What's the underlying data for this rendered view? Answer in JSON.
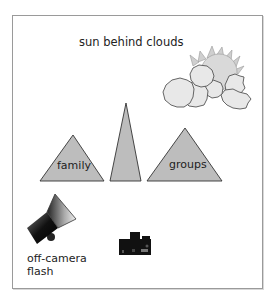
{
  "diagram": {
    "title": "sun behind clouds",
    "labels": {
      "family": "family",
      "groups": "groups",
      "flash_line1": "off-camera",
      "flash_line2": "flash"
    },
    "icons": [
      "sun-icon",
      "cloud-icon",
      "triangle-family",
      "triangle-middle",
      "triangle-groups",
      "flash-icon",
      "camera-icon"
    ],
    "colors": {
      "triangle_fill": "#bdbdbd",
      "cloud_fill": "#e6e6e6",
      "sun_fill": "#d6d6d6",
      "outline": "#333333",
      "frame_border": "#9a9a9a"
    }
  }
}
